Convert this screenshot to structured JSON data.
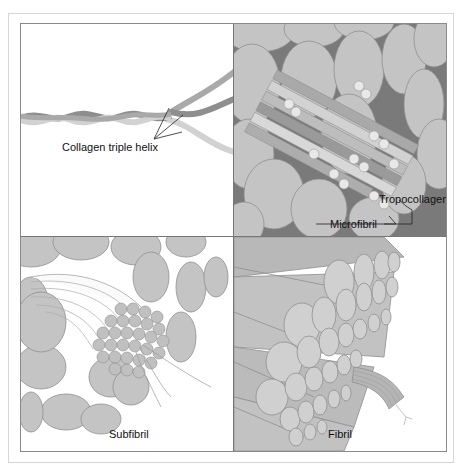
{
  "figure": {
    "panels": [
      {
        "id": "triple-helix",
        "position": "top-left",
        "labels": [
          "Collagen triple helix"
        ]
      },
      {
        "id": "microfibril",
        "position": "top-right",
        "labels": [
          "Tropocollagen",
          "Microfibril"
        ]
      },
      {
        "id": "subfibril",
        "position": "bottom-left",
        "labels": [
          "Subfibril"
        ]
      },
      {
        "id": "fibril",
        "position": "bottom-right",
        "labels": [
          "Fibril"
        ]
      }
    ]
  },
  "labels": {
    "triple_helix": "Collagen triple helix",
    "tropocollagen": "Tropocollagen",
    "microfibril": "Microfibril",
    "subfibril": "Subfibril",
    "fibril": "Fibril"
  },
  "colors": {
    "fiber_fill": "#c4c4c4",
    "fiber_stroke": "#8f8f8f",
    "background_dark": "#7a7a7a",
    "strand_dark": "#8e8e8e",
    "strand_mid": "#a9a9a9",
    "strand_light": "#d2d2d2",
    "border": "#777777"
  }
}
